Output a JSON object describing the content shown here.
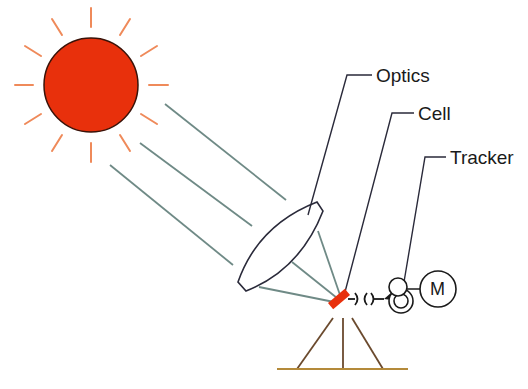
{
  "diagram": {
    "labels": {
      "optics": "Optics",
      "cell": "Cell",
      "tracker": "Tracker",
      "motor": "M"
    },
    "components": [
      {
        "name": "sun",
        "shape": "circle-with-rays",
        "color": "#e8300c"
      },
      {
        "name": "light-rays",
        "count": 3,
        "color": "#6f8a86"
      },
      {
        "name": "optics-lens",
        "shape": "biconvex-lens"
      },
      {
        "name": "converging-rays",
        "count": 3
      },
      {
        "name": "cell",
        "shape": "tilted-rectangle",
        "color": "#e8300c"
      },
      {
        "name": "coupling-shaft"
      },
      {
        "name": "tracker-gears",
        "count": 2
      },
      {
        "name": "motor",
        "label": "M"
      },
      {
        "name": "tripod-stand",
        "color": "#6b4a2e"
      }
    ],
    "colors": {
      "sun_fill": "#e8300c",
      "sun_rays": "#ef8a5a",
      "light_rays": "#6f8a86",
      "outline": "#2a2a3a",
      "cell": "#e8300c",
      "stand": "#6b4a2e",
      "ground": "#b48a3a"
    }
  }
}
